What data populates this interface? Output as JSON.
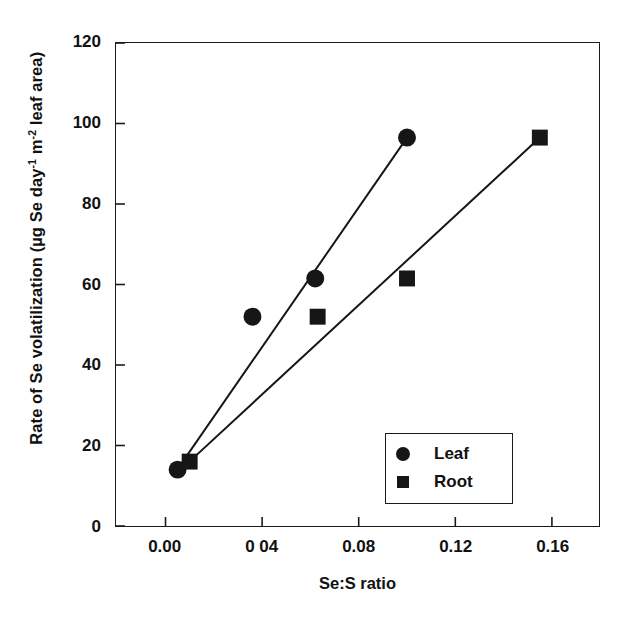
{
  "chart_data": {
    "type": "scatter",
    "title": "",
    "xlabel": "Se:S ratio",
    "ylabel": "Rate of Se volatilization (µg Se day⁻¹ m⁻² leaf area)",
    "ylabel_parts": {
      "prefix": "Rate of Se volatilization (µg Se day",
      "sup1": "-1",
      "mid": " m",
      "sup2": "-2",
      "suffix": " leaf area)"
    },
    "xlim": [
      -0.0205,
      0.1795
    ],
    "ylim": [
      0,
      120
    ],
    "grid": false,
    "legend_position": "inside-lower-right",
    "xticks": [
      0.0,
      0.04,
      0.08,
      0.12,
      0.16
    ],
    "xtick_labels": [
      "0.00",
      "0 04",
      "0.08",
      "0.12",
      "0.16"
    ],
    "yticks": [
      0,
      20,
      40,
      60,
      80,
      100,
      120
    ],
    "ytick_labels": [
      "0",
      "20",
      "40",
      "60",
      "80",
      "100",
      "120"
    ],
    "series": [
      {
        "name": "Leaf",
        "marker": "circle",
        "color": "#161616",
        "points": [
          {
            "x": 0.005,
            "y": 14.0
          },
          {
            "x": 0.036,
            "y": 52.0
          },
          {
            "x": 0.062,
            "y": 61.5
          },
          {
            "x": 0.1,
            "y": 96.5
          }
        ],
        "fit_line": {
          "x1": 0.006,
          "y1": 15.0,
          "x2": 0.1,
          "y2": 96.5
        }
      },
      {
        "name": "Root",
        "marker": "square",
        "color": "#161616",
        "points": [
          {
            "x": 0.01,
            "y": 16.0
          },
          {
            "x": 0.063,
            "y": 52.0
          },
          {
            "x": 0.1,
            "y": 61.5
          },
          {
            "x": 0.155,
            "y": 96.5
          }
        ],
        "fit_line": {
          "x1": 0.009,
          "y1": 15.5,
          "x2": 0.155,
          "y2": 96.5
        }
      }
    ],
    "legend": [
      {
        "label": "Leaf",
        "marker": "circle"
      },
      {
        "label": "Root",
        "marker": "square"
      }
    ]
  }
}
